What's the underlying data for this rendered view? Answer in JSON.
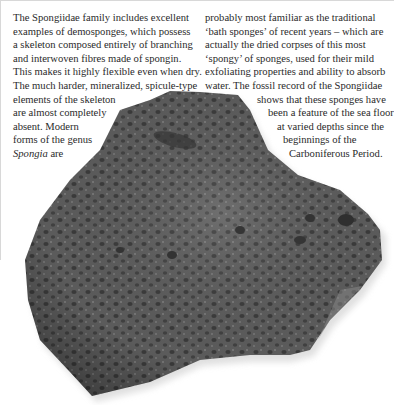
{
  "article": {
    "left_column": {
      "lines": [
        "The Spongiidae family includes excellent",
        "examples of demosponges, which possess",
        "a skeleton composed entirely of branching",
        "and interwoven fibres made of spongin.",
        "This makes it highly flexible even when dry.",
        "The much harder, mineralized, spicule-type",
        "elements of the skeleton",
        "are almost completely",
        "absent. Modern",
        "forms of the genus"
      ],
      "last_line_italic": "Spongia",
      "last_line_rest": " are"
    },
    "right_column": {
      "lines": [
        "probably most familiar as the traditional",
        "‘bath sponges’ of recent years – which are",
        "actually the dried corpses of this most",
        "‘spongy’ of sponges, used for their mild",
        "exfoliating properties and ability to absorb",
        "water. The fossil record of the Spongiidae",
        "shows that these sponges have",
        "been a feature of the sea floor",
        "at varied depths since the",
        "beginnings of the",
        "Carboniferous Period."
      ]
    }
  },
  "figure": {
    "colors": {
      "body": "#5a5a5a",
      "dark": "#3c3c3c",
      "light": "#8a8a8a",
      "shadow": "#e6e6e6"
    }
  }
}
